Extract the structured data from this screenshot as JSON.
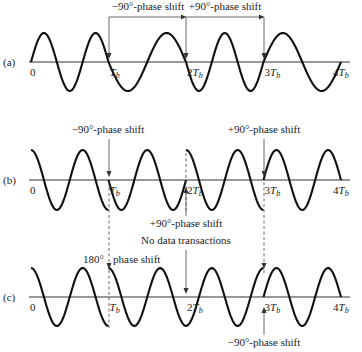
{
  "figure": {
    "panels": [
      {
        "id": "a",
        "label": "(a)",
        "baseline_y": 62,
        "amplitude": 29,
        "ticks": [
          "0",
          "T_b",
          "2T_b",
          "3T_b",
          "4T_b"
        ],
        "segments": [
          {
            "start": 0,
            "end": 1,
            "cycles": 1.5,
            "phase_deg": 0
          },
          {
            "start": 1,
            "end": 2,
            "cycles": 1.0,
            "phase_deg": 180
          },
          {
            "start": 2,
            "end": 3,
            "cycles": 1.5,
            "phase_deg": 180
          },
          {
            "start": 3,
            "end": 4,
            "cycles": 1.0,
            "phase_deg": 0
          }
        ],
        "annotations": [
          {
            "text": "−90°-phase shift",
            "x": 148,
            "y": 10
          },
          {
            "text": "+90°-phase shift",
            "x": 225,
            "y": 10
          }
        ]
      },
      {
        "id": "b",
        "label": "(b)",
        "baseline_y": 180,
        "amplitude": 30,
        "ticks": [
          "0",
          "T_b",
          "2T_b",
          "3T_b",
          "4T_b"
        ],
        "segments": [
          {
            "start": 0,
            "end": 1,
            "cycles": 1.5,
            "phase_deg": 90
          },
          {
            "start": 1,
            "end": 2,
            "cycles": 1.5,
            "phase_deg": 180
          },
          {
            "start": 2,
            "end": 3,
            "cycles": 1.5,
            "phase_deg": 90
          },
          {
            "start": 3,
            "end": 4,
            "cycles": 1.5,
            "phase_deg": 0
          }
        ],
        "annotations": [
          {
            "text": "−90°-phase shift",
            "x": 108,
            "y": 133
          },
          {
            "text": "+90°-phase shift",
            "x": 264,
            "y": 133
          },
          {
            "text": "+90°-phase shift",
            "x": 186,
            "y": 227
          }
        ]
      },
      {
        "id": "c",
        "label": "(c)",
        "baseline_y": 297,
        "amplitude": 29,
        "ticks": [
          "0",
          "T_b",
          "2T_b",
          "3T_b",
          "4T_b"
        ],
        "segments": [
          {
            "start": 0,
            "end": 1,
            "cycles": 1.5,
            "phase_deg": 90
          },
          {
            "start": 1,
            "end": 3,
            "cycles": 3.0,
            "phase_deg": 90
          },
          {
            "start": 3,
            "end": 4,
            "cycles": 1.5,
            "phase_deg": 0
          }
        ],
        "annotations": [
          {
            "text": "No data transactions",
            "x": 186,
            "y": 244
          },
          {
            "text": "180°",
            "x": 97,
            "y": 263
          },
          {
            "text": "phase shift",
            "x": 113,
            "y": 263
          },
          {
            "text": "−90°-phase shift",
            "x": 264,
            "y": 346
          }
        ]
      }
    ],
    "time_axis": {
      "x0": 31,
      "px_per_Tb": 77.5,
      "x_end": 350
    }
  },
  "chart_data": {
    "type": "line",
    "title": "",
    "xlabel": "time",
    "ylabel": "",
    "x_ticks": [
      "0",
      "Tb",
      "2Tb",
      "3Tb",
      "4Tb"
    ],
    "series": [
      {
        "name": "(a)",
        "description": "FSK-like: 1.5 / 1 / 1.5 / 1 cycles per bit, continuous phase",
        "events": [
          {
            "t": 1,
            "label": "-90°-phase shift"
          },
          {
            "t": 2,
            "label": "+90°-phase shift"
          },
          {
            "t": 3,
            "label": "bracket end"
          }
        ]
      },
      {
        "name": "(b)",
        "description": "1.5 cycles per bit with phase jumps",
        "events": [
          {
            "t": 1,
            "label": "-90°-phase shift"
          },
          {
            "t": 2,
            "label": "+90°-phase shift"
          },
          {
            "t": 3,
            "label": "+90°-phase shift"
          }
        ]
      },
      {
        "name": "(c)",
        "description": "1.5 cycles per bit",
        "events": [
          {
            "t": 1,
            "label": "180° phase shift"
          },
          {
            "t": 2,
            "label": "No data transactions"
          },
          {
            "t": 3,
            "label": "-90°-phase shift"
          }
        ]
      }
    ]
  }
}
